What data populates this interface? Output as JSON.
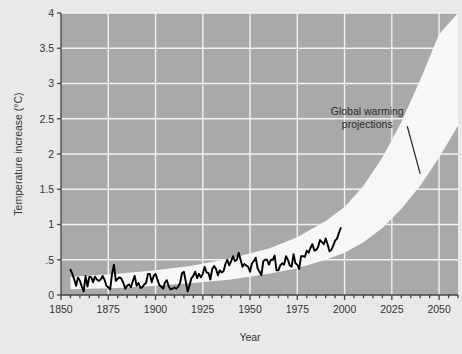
{
  "chart_data": {
    "type": "line",
    "title": "",
    "xlabel": "Year",
    "ylabel": "Temperature increase (°C)",
    "xlim": [
      1850,
      2060
    ],
    "ylim": [
      0,
      4
    ],
    "grid": true,
    "legend_position": "none",
    "background_color": "#a9a9a9",
    "outer_background_color": "#e9e9e9",
    "grid_color": "#f2f2f2",
    "xticks": [
      1850,
      1875,
      1900,
      1925,
      1950,
      1975,
      2000,
      2025,
      2050
    ],
    "xtick_labels": [
      "1850",
      "1875",
      "1900",
      "1925",
      "1950",
      "1975",
      "2000",
      "2025",
      "2050"
    ],
    "xminor_tick_interval": 5,
    "yticks": [
      0,
      0.5,
      1,
      1.5,
      2,
      2.5,
      3,
      3.5,
      4
    ],
    "ytick_labels": [
      "0",
      ".5",
      "1",
      "1.5",
      "2",
      "2.5",
      "3",
      "3.5",
      "4"
    ],
    "annotations": [
      {
        "text_line1": "Global warming",
        "text_line2": "projections",
        "x": 2012,
        "y": 2.55,
        "leader_to_x": 2040,
        "leader_to_y": 1.72,
        "color": "#2b2b2b"
      }
    ],
    "series": [
      {
        "name": "Observed temperature increase",
        "type": "line",
        "color": "#000000",
        "line_width": 1.9,
        "x": [
          1855,
          1856,
          1857,
          1858,
          1859,
          1860,
          1861,
          1862,
          1863,
          1864,
          1865,
          1866,
          1867,
          1868,
          1869,
          1870,
          1871,
          1872,
          1873,
          1874,
          1875,
          1876,
          1877,
          1878,
          1879,
          1880,
          1881,
          1882,
          1883,
          1884,
          1885,
          1886,
          1887,
          1888,
          1889,
          1890,
          1891,
          1892,
          1893,
          1894,
          1895,
          1896,
          1897,
          1898,
          1899,
          1900,
          1901,
          1902,
          1903,
          1904,
          1905,
          1906,
          1907,
          1908,
          1909,
          1910,
          1911,
          1912,
          1913,
          1914,
          1915,
          1916,
          1917,
          1918,
          1919,
          1920,
          1921,
          1922,
          1923,
          1924,
          1925,
          1926,
          1927,
          1928,
          1929,
          1930,
          1931,
          1932,
          1933,
          1934,
          1935,
          1936,
          1937,
          1938,
          1939,
          1940,
          1941,
          1942,
          1943,
          1944,
          1945,
          1946,
          1947,
          1948,
          1949,
          1950,
          1951,
          1952,
          1953,
          1954,
          1955,
          1956,
          1957,
          1958,
          1959,
          1960,
          1961,
          1962,
          1963,
          1964,
          1965,
          1966,
          1967,
          1968,
          1969,
          1970,
          1971,
          1972,
          1973,
          1974,
          1975,
          1976,
          1977,
          1978,
          1979,
          1980,
          1981,
          1982,
          1983,
          1984,
          1985,
          1986,
          1987,
          1988,
          1989,
          1990,
          1991,
          1992,
          1993,
          1994,
          1995,
          1996,
          1997,
          1998
        ],
        "y": [
          0.36,
          0.3,
          0.22,
          0.13,
          0.25,
          0.2,
          0.12,
          0.05,
          0.27,
          0.12,
          0.26,
          0.25,
          0.18,
          0.26,
          0.22,
          0.2,
          0.22,
          0.27,
          0.22,
          0.13,
          0.11,
          0.08,
          0.3,
          0.43,
          0.2,
          0.23,
          0.25,
          0.23,
          0.17,
          0.09,
          0.13,
          0.15,
          0.11,
          0.2,
          0.27,
          0.13,
          0.17,
          0.1,
          0.11,
          0.15,
          0.17,
          0.3,
          0.3,
          0.18,
          0.27,
          0.3,
          0.22,
          0.14,
          0.12,
          0.09,
          0.18,
          0.21,
          0.12,
          0.08,
          0.09,
          0.11,
          0.09,
          0.12,
          0.17,
          0.31,
          0.33,
          0.19,
          0.05,
          0.14,
          0.24,
          0.27,
          0.33,
          0.24,
          0.3,
          0.25,
          0.3,
          0.4,
          0.32,
          0.31,
          0.22,
          0.37,
          0.41,
          0.37,
          0.28,
          0.35,
          0.32,
          0.34,
          0.44,
          0.5,
          0.42,
          0.48,
          0.55,
          0.48,
          0.5,
          0.6,
          0.5,
          0.4,
          0.44,
          0.42,
          0.4,
          0.33,
          0.45,
          0.48,
          0.53,
          0.38,
          0.33,
          0.28,
          0.48,
          0.5,
          0.5,
          0.43,
          0.5,
          0.5,
          0.56,
          0.35,
          0.35,
          0.42,
          0.45,
          0.43,
          0.55,
          0.5,
          0.42,
          0.4,
          0.58,
          0.45,
          0.43,
          0.37,
          0.55,
          0.55,
          0.54,
          0.63,
          0.6,
          0.67,
          0.72,
          0.63,
          0.64,
          0.68,
          0.78,
          0.75,
          0.72,
          0.8,
          0.72,
          0.62,
          0.64,
          0.7,
          0.77,
          0.8,
          0.88,
          0.95
        ]
      }
    ],
    "bands": [
      {
        "name": "Global warming projection range",
        "color": "#f7f7f7",
        "x": [
          1855,
          1880,
          1900,
          1920,
          1940,
          1960,
          1975,
          1990,
          2000,
          2010,
          2020,
          2030,
          2040,
          2050,
          2060
        ],
        "y_lower": [
          0.08,
          0.1,
          0.13,
          0.17,
          0.22,
          0.3,
          0.38,
          0.5,
          0.6,
          0.75,
          0.95,
          1.22,
          1.55,
          1.95,
          2.4
        ],
        "y_upper": [
          0.26,
          0.3,
          0.35,
          0.42,
          0.52,
          0.66,
          0.82,
          1.05,
          1.25,
          1.55,
          1.95,
          2.45,
          3.05,
          3.7,
          4.0
        ]
      }
    ]
  },
  "axis": {
    "y_title": "Temperature increase (°C)",
    "x_title": "Year"
  }
}
